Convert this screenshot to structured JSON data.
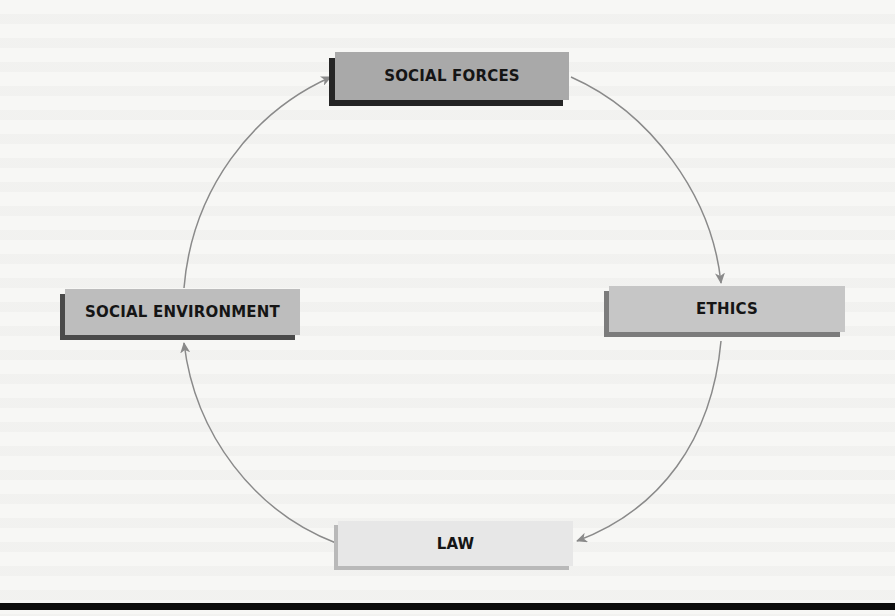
{
  "diagram": {
    "type": "cycle",
    "nodes": [
      {
        "id": "social_forces",
        "label": "SOCIAL FORCES",
        "fill": "#a9a9a9",
        "shadow": "#262626"
      },
      {
        "id": "ethics",
        "label": "ETHICS",
        "fill": "#c6c6c6",
        "shadow": "#7c7c7c"
      },
      {
        "id": "law",
        "label": "LAW",
        "fill": "#e7e7e7",
        "shadow": "#b9b9b9"
      },
      {
        "id": "social_environment",
        "label": "SOCIAL ENVIRONMENT",
        "fill": "#bdbdbd",
        "shadow": "#4a4a4a"
      }
    ],
    "edges": [
      {
        "from": "social_forces",
        "to": "ethics"
      },
      {
        "from": "ethics",
        "to": "law"
      },
      {
        "from": "law",
        "to": "social_environment"
      },
      {
        "from": "social_environment",
        "to": "social_forces"
      }
    ],
    "arrow_color": "#8a8a8a",
    "rule_color": "#0d0d0d"
  }
}
